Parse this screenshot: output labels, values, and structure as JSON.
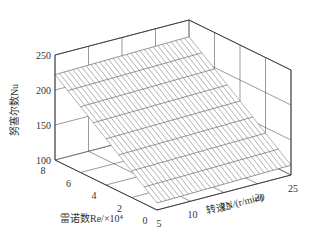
{
  "chart_data": {
    "type": "surface3d",
    "title": "",
    "xlabel": "转速N/(r/min)",
    "ylabel": "雷诺数Re/×10⁴",
    "zlabel": "努塞尔数Nu",
    "x_ticks": [
      5,
      10,
      15,
      20,
      25
    ],
    "y_ticks": [
      0,
      2,
      4,
      6,
      8
    ],
    "z_ticks": [
      100,
      150,
      200,
      250
    ],
    "xlim": [
      5,
      25
    ],
    "ylim": [
      0,
      8
    ],
    "zlim": [
      100,
      250
    ],
    "grid": true,
    "surface": {
      "x": [
        5,
        25
      ],
      "y": [
        0,
        1,
        2,
        3,
        4,
        5,
        6,
        7,
        8
      ],
      "description": "Nu increases roughly linearly with Re; weak increase with N",
      "z_at_x5": [
        110,
        124,
        138,
        152,
        166,
        180,
        194,
        208,
        222
      ],
      "z_at_x25": [
        114,
        128,
        142,
        156,
        170,
        184,
        198,
        212,
        226
      ]
    },
    "x_mesh_lines": 30,
    "y_mesh_lines": 9
  }
}
